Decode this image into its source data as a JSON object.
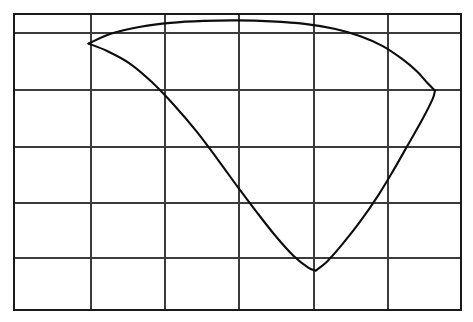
{
  "figure": {
    "title": "",
    "background_color": "#ffffff",
    "width": 473,
    "height": 322
  },
  "chart_data": {
    "type": "line",
    "title": "",
    "subtitle": "",
    "xlabel": "",
    "ylabel": "",
    "grid": true,
    "legend": [],
    "legend_position": "none",
    "axis_labels_shown": false,
    "tick_labels_shown": false,
    "xlim": [
      0,
      6
    ],
    "ylim": [
      0,
      6
    ],
    "x_gridlines": [
      0,
      1,
      2,
      3,
      4,
      5,
      6
    ],
    "y_gridlines": [
      0,
      1,
      2,
      3,
      4,
      5,
      6
    ],
    "colors": {
      "curve": "#0d0d0d",
      "grid": "#3b3b3b",
      "border": "#1a1a1a",
      "background": "#ffffff"
    },
    "annotations": [],
    "series": [
      {
        "name": "upper-branch",
        "description": "Upper branch rising from start node, flat crest near top border, descending to right cusp",
        "x": [
          1.0,
          1.3,
          1.7,
          2.1,
          2.55,
          3.0,
          3.45,
          3.9,
          4.3,
          4.65,
          4.95,
          5.2,
          5.4,
          5.55,
          5.65
        ],
        "y": [
          5.4,
          5.6,
          5.74,
          5.82,
          5.86,
          5.87,
          5.85,
          5.8,
          5.7,
          5.55,
          5.35,
          5.1,
          4.85,
          4.6,
          4.45
        ]
      },
      {
        "name": "lower-branch",
        "description": "Lower branch descending from start node to valley minimum",
        "x": [
          1.0,
          1.25,
          1.55,
          1.85,
          2.15,
          2.45,
          2.75,
          3.0,
          3.25,
          3.5,
          3.75,
          3.95,
          4.05
        ],
        "y": [
          5.4,
          5.25,
          5.0,
          4.62,
          4.15,
          3.62,
          3.02,
          2.5,
          2.0,
          1.52,
          1.1,
          0.86,
          0.8
        ]
      },
      {
        "name": "recovery-branch",
        "description": "Ascending branch from valley minimum to right cusp",
        "x": [
          4.05,
          4.2,
          4.4,
          4.65,
          4.9,
          5.1,
          5.3,
          5.48,
          5.62,
          5.65
        ],
        "y": [
          0.8,
          0.98,
          1.32,
          1.8,
          2.35,
          2.85,
          3.38,
          3.86,
          4.28,
          4.45
        ]
      }
    ],
    "key_points": [
      {
        "name": "start-node",
        "x": 1.0,
        "y": 5.4
      },
      {
        "name": "crest",
        "x": 3.0,
        "y": 5.87
      },
      {
        "name": "valley-minimum",
        "x": 4.05,
        "y": 0.8
      },
      {
        "name": "right-cusp",
        "x": 5.65,
        "y": 4.45
      }
    ]
  }
}
